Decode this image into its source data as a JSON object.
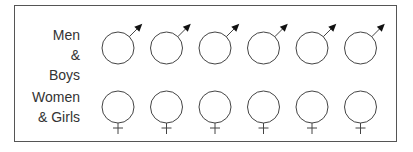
{
  "rows": [
    {
      "label_line1": "Men &",
      "label_line2": "Boys",
      "symbol": "male-symbol-icon",
      "count": 6
    },
    {
      "label_line1": "Women",
      "label_line2": "& Girls",
      "symbol": "female-symbol-icon",
      "count": 6
    }
  ],
  "colors": {
    "stroke": "#444444",
    "border": "#555555",
    "text": "#333333"
  }
}
